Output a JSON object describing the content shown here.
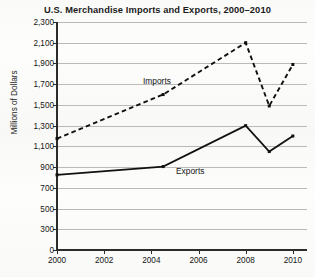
{
  "chart_data": {
    "type": "line",
    "title": "U.S. Merchandise Imports and Exports, 2000–2010",
    "xlabel": "",
    "ylabel": "Millions of Dollars",
    "x": [
      2000,
      2004.5,
      2008,
      2009,
      2010
    ],
    "xlim": [
      2000,
      2010.6
    ],
    "ylim": [
      0,
      2300
    ],
    "grid": true,
    "legend_position": "inline-annotation",
    "ytick_labels": [
      "2,300",
      "2,100",
      "1,900",
      "1,700",
      "1,500",
      "1,300",
      "1,100",
      "900",
      "700",
      "500",
      "300",
      "0"
    ],
    "ytick_values": [
      2300,
      2100,
      1900,
      1700,
      1500,
      1300,
      1100,
      900,
      700,
      500,
      300,
      0
    ],
    "xtick_labels": [
      "2000",
      "2002",
      "2004",
      "2006",
      "2008",
      "2010"
    ],
    "xtick_values": [
      2000,
      2002,
      2004,
      2006,
      2008,
      2010
    ],
    "series": [
      {
        "name": "Imports",
        "style": "dashed",
        "color": "#111111",
        "values": [
          1175,
          1600,
          2100,
          1490,
          1890
        ]
      },
      {
        "name": "Exports",
        "style": "solid",
        "color": "#111111",
        "values": [
          825,
          905,
          1300,
          1050,
          1200
        ]
      }
    ],
    "annotations": [
      {
        "text": "Imports",
        "series": "Imports"
      },
      {
        "text": "Exports",
        "series": "Exports"
      }
    ]
  }
}
